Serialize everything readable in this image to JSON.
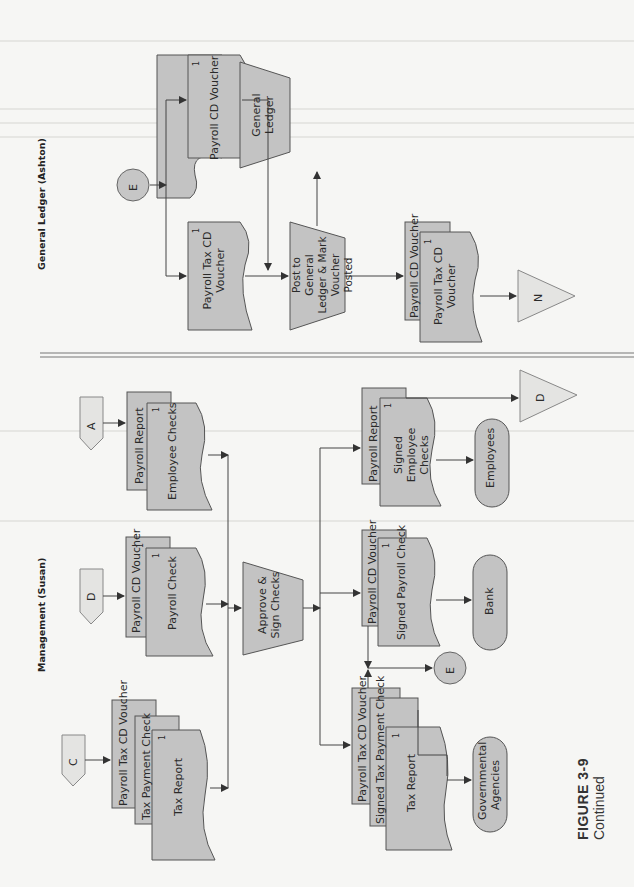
{
  "figure": {
    "number": "FIGURE 3-9",
    "caption": "Continued"
  },
  "lanes": {
    "general_ledger": {
      "title": "General Ledger (Ashton)"
    },
    "management": {
      "title": "Management (Susan)"
    }
  },
  "general_ledger": {
    "connector_in": "E",
    "doc_payroll_cd_voucher": {
      "label": "Payroll CD Voucher",
      "copy": "1"
    },
    "doc_payroll_tax_cd_voucher": {
      "label": "Payroll Tax CD Voucher",
      "copy": "1"
    },
    "process_post": {
      "label": "Post to General Ledger & Mark Voucher Posted"
    },
    "file_general_ledger": {
      "label": "General Ledger"
    },
    "output_stack": [
      {
        "label": "Payroll CD Voucher",
        "copy": "1"
      },
      {
        "label": "Payroll Tax CD Voucher",
        "copy": "1"
      }
    ],
    "offpage_out": "N"
  },
  "management": {
    "offpage_in": [
      {
        "id": "A",
        "docs": [
          {
            "label": "Payroll Report",
            "copy": ""
          },
          {
            "label": "Employee Checks",
            "copy": "1"
          }
        ]
      },
      {
        "id": "D",
        "docs": [
          {
            "label": "Payroll CD Voucher",
            "copy": "1"
          },
          {
            "label": "Payroll Check",
            "copy": "1"
          }
        ]
      },
      {
        "id": "C",
        "docs": [
          {
            "label": "Payroll Tax CD Voucher",
            "copy": "1"
          },
          {
            "label": "Tax Payment Check",
            "copy": "1"
          },
          {
            "label": "Tax Report",
            "copy": "1"
          }
        ]
      }
    ],
    "process_approve": {
      "label": "Approve & Sign Checks"
    },
    "outputs": [
      {
        "docs": [
          {
            "label": "Payroll Report",
            "copy": ""
          },
          {
            "label": "Signed Employee Checks",
            "copy": "1"
          }
        ],
        "terminal": "Employees",
        "offpage": "D"
      },
      {
        "docs": [
          {
            "label": "Payroll CD Voucher",
            "copy": "1"
          },
          {
            "label": "Signed Payroll Check",
            "copy": "1"
          }
        ],
        "terminal": "Bank",
        "connector": "E"
      },
      {
        "docs": [
          {
            "label": "Payroll Tax CD Voucher",
            "copy": "1"
          },
          {
            "label": "Signed Tax Payment Check",
            "copy": "1"
          },
          {
            "label": "Tax Report",
            "copy": "1"
          }
        ],
        "terminal": "Governmental Agencies"
      }
    ]
  }
}
